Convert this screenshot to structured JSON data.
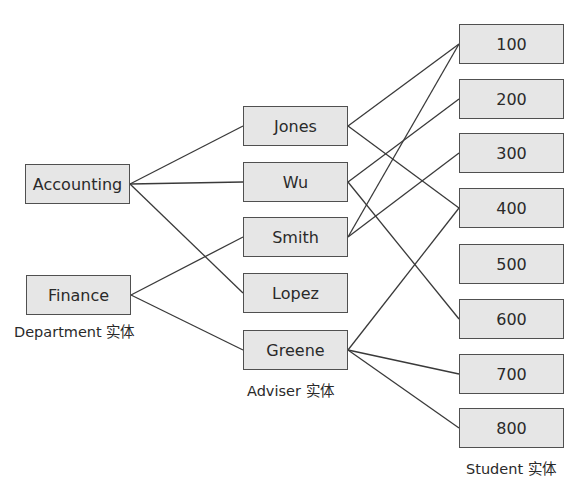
{
  "departments": [
    {
      "id": "accounting",
      "label": "Accounting",
      "x": 25,
      "y": 164
    },
    {
      "id": "finance",
      "label": "Finance",
      "x": 26,
      "y": 275
    }
  ],
  "advisers": [
    {
      "id": "jones",
      "label": "Jones",
      "x": 243,
      "y": 106
    },
    {
      "id": "wu",
      "label": "Wu",
      "x": 243,
      "y": 162
    },
    {
      "id": "smith",
      "label": "Smith",
      "x": 243,
      "y": 217
    },
    {
      "id": "lopez",
      "label": "Lopez",
      "x": 243,
      "y": 273
    },
    {
      "id": "greene",
      "label": "Greene",
      "x": 243,
      "y": 330
    }
  ],
  "students": [
    {
      "id": "s100",
      "label": "100",
      "x": 459,
      "y": 24
    },
    {
      "id": "s200",
      "label": "200",
      "x": 459,
      "y": 79
    },
    {
      "id": "s300",
      "label": "300",
      "x": 459,
      "y": 133
    },
    {
      "id": "s400",
      "label": "400",
      "x": 459,
      "y": 188
    },
    {
      "id": "s500",
      "label": "500",
      "x": 459,
      "y": 244
    },
    {
      "id": "s600",
      "label": "600",
      "x": 459,
      "y": 299
    },
    {
      "id": "s700",
      "label": "700",
      "x": 459,
      "y": 354
    },
    {
      "id": "s800",
      "label": "800",
      "x": 459,
      "y": 408
    }
  ],
  "captions": {
    "department": "Department 实体",
    "adviser": "Adviser 实体",
    "student": "Student 实体"
  },
  "department_adviser_links": [
    [
      "accounting",
      "jones"
    ],
    [
      "accounting",
      "wu"
    ],
    [
      "accounting",
      "lopez"
    ],
    [
      "finance",
      "smith"
    ],
    [
      "finance",
      "greene"
    ]
  ],
  "adviser_student_links": [
    [
      "jones",
      "s100"
    ],
    [
      "jones",
      "s400"
    ],
    [
      "wu",
      "s200"
    ],
    [
      "wu",
      "s600"
    ],
    [
      "smith",
      "s100"
    ],
    [
      "smith",
      "s300"
    ],
    [
      "greene",
      "s400"
    ],
    [
      "greene",
      "s700"
    ],
    [
      "greene",
      "s800"
    ]
  ],
  "colors": {
    "box_fill": "#e6e6e6",
    "box_border": "#505050",
    "line": "#3a3a3a",
    "text": "#2a2a2a"
  }
}
